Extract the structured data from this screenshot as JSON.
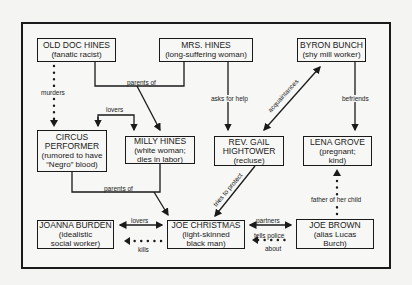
{
  "nodes": {
    "old_doc_hines": {
      "title": "OLD DOC HINES",
      "sub1": "(fanatic racist)"
    },
    "mrs_hines": {
      "title": "MRS. HINES",
      "sub1": "(long-suffering woman)"
    },
    "byron_bunch": {
      "title": "BYRON BUNCH",
      "sub1": "(shy mill worker)"
    },
    "circus_performer": {
      "title": "CIRCUS",
      "title2": "PERFORMER",
      "sub1": "(rumored to have",
      "sub2": "“Negro” blood)"
    },
    "milly_hines": {
      "title": "MILLY HINES",
      "sub1": "(white woman;",
      "sub2": "dies in labor)"
    },
    "rev_gail_hightower": {
      "title": "REV. GAIL",
      "title2": "HIGHTOWER",
      "sub1": "(recluse)"
    },
    "lena_grove": {
      "title": "LENA GROVE",
      "sub1": "(pregnant;",
      "sub2": "kind)"
    },
    "joanna_burden": {
      "title": "JOANNA BURDEN",
      "sub1": "(idealistic",
      "sub2": "social worker)"
    },
    "joe_christmas": {
      "title": "JOE CHRISTMAS",
      "sub1": "(light-skinned",
      "sub2": "black man)"
    },
    "joe_brown": {
      "title": "JOE BROWN",
      "sub1": "(alias Lucas",
      "sub2": "Burch)"
    }
  },
  "edges": {
    "murders": "murders",
    "parents_of_top": "parents of",
    "lovers_top": "lovers",
    "asks_for_help": "asks for help",
    "acquaintances": "acquaintances",
    "befriends": "befriends",
    "parents_of_bottom": "parents of",
    "tries_to_protect": "tries to protect",
    "father_of_her_child": "father of her child",
    "lovers_bottom": "lovers",
    "kills": "kills",
    "partners": "partners",
    "tells_police": "tells police",
    "about": "about"
  }
}
